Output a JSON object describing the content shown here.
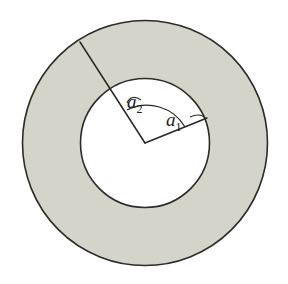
{
  "figure": {
    "title": "Annulus with inner and outer radii",
    "background_color": "#ffffff",
    "ring_fill_color": "#d5d4ca",
    "inner_fill_color": "#ffffff",
    "stroke_color": "#2b2b28",
    "line_color": "#262624"
  },
  "geometry": {
    "center_x": 145,
    "center_y": 143,
    "outer_radius": 123,
    "inner_radius": 65
  },
  "labels": {
    "inner_radius_label": {
      "base": "a",
      "subscript": "1",
      "x": 166,
      "y": 126
    },
    "outer_radius_label": {
      "base": "a",
      "subscript": "2",
      "x": 127,
      "y": 108
    }
  },
  "radii": {
    "inner": {
      "name": "a1",
      "from_x": 145,
      "from_y": 143,
      "to_x": 207,
      "to_y": 118
    },
    "outer": {
      "name": "a2",
      "from_x": 145,
      "from_y": 143,
      "to_x": 80,
      "to_y": 42
    }
  }
}
